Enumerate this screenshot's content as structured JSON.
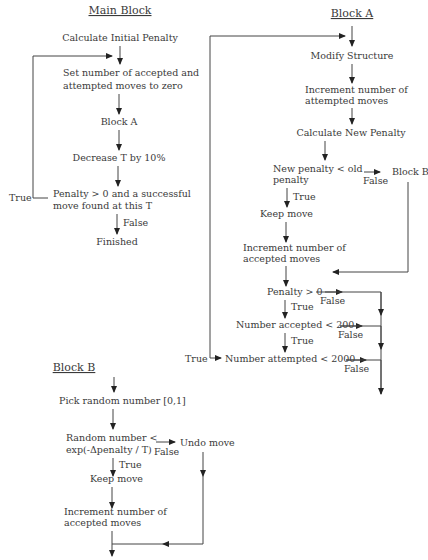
{
  "main_block": {
    "title": "Main Block",
    "steps": {
      "calc_initial": "Calculate Initial Penalty",
      "set_zero_1": "Set number of accepted and",
      "set_zero_2": "attempted moves to zero",
      "block_a": "Block A",
      "decrease_t": "Decrease T by 10%",
      "cond_1": "Penalty > 0 and a successful",
      "cond_2": "move found at this T",
      "finished": "Finished"
    },
    "labels": {
      "true": "True",
      "false": "False"
    }
  },
  "block_a": {
    "title": "Block A",
    "steps": {
      "modify": "Modify Structure",
      "inc_attempted_1": "Increment number of",
      "inc_attempted_2": "attempted moves",
      "calc_new": "Calculate New Penalty",
      "cond_new_1": "New penalty < old",
      "cond_new_2": "penalty",
      "block_b": "Block B",
      "keep": "Keep move",
      "inc_accepted_1": "Increment number of",
      "inc_accepted_2": "accepted moves",
      "cond_penalty": "Penalty > 0",
      "cond_accepted": "Number accepted < 200",
      "cond_attempted": "Number attempted < 2000"
    },
    "labels": {
      "true": "True",
      "false": "False"
    }
  },
  "block_b": {
    "title": "Block B",
    "steps": {
      "pick": "Pick random number [0,1]",
      "cond_1": "Random number <",
      "cond_2": "exp(-Δpenalty / T)",
      "undo": "Undo move",
      "keep": "Keep move",
      "inc_accepted_1": "Increment number of",
      "inc_accepted_2": "accepted moves"
    },
    "labels": {
      "true": "True",
      "false": "False"
    }
  }
}
